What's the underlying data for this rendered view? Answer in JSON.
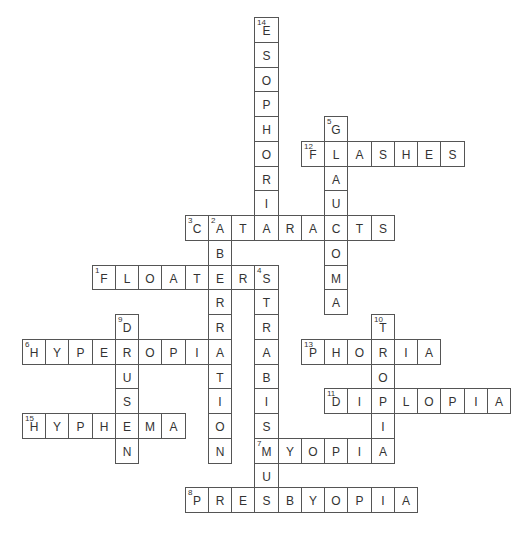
{
  "puzzle": {
    "type": "crossword",
    "grid_origin": {
      "x": 22,
      "y": 17
    },
    "cell": {
      "w": 23.24,
      "h": 24.75
    },
    "line_color": "#555555",
    "text_color": "#333333",
    "words": [
      {
        "number": 1,
        "direction": "across",
        "row": 10,
        "col": 3,
        "answer": "FLOATERS"
      },
      {
        "number": 2,
        "direction": "down",
        "row": 8,
        "col": 8,
        "answer": "ABERRATION"
      },
      {
        "number": 3,
        "direction": "across",
        "row": 8,
        "col": 7,
        "answer": "CATARACTS"
      },
      {
        "number": 4,
        "direction": "down",
        "row": 10,
        "col": 10,
        "answer": "STRABISMUS"
      },
      {
        "number": 5,
        "direction": "down",
        "row": 4,
        "col": 13,
        "answer": "GLAUCOMA"
      },
      {
        "number": 6,
        "direction": "across",
        "row": 13,
        "col": 0,
        "answer": "HYPEROPIA"
      },
      {
        "number": 7,
        "direction": "across",
        "row": 17,
        "col": 10,
        "answer": "MYOPIA"
      },
      {
        "number": 8,
        "direction": "across",
        "row": 19,
        "col": 7,
        "answer": "PRESBYOPIA"
      },
      {
        "number": 9,
        "direction": "down",
        "row": 12,
        "col": 4,
        "answer": "DRUSEN"
      },
      {
        "number": 10,
        "direction": "down",
        "row": 12,
        "col": 15,
        "answer": "TROPIA"
      },
      {
        "number": 11,
        "direction": "across",
        "row": 15,
        "col": 13,
        "answer": "DIPLOPIA"
      },
      {
        "number": 12,
        "direction": "across",
        "row": 5,
        "col": 12,
        "answer": "FLASHES"
      },
      {
        "number": 13,
        "direction": "across",
        "row": 13,
        "col": 12,
        "answer": "PHORIA"
      },
      {
        "number": 14,
        "direction": "down",
        "row": 0,
        "col": 10,
        "answer": "ESOPHORIA"
      },
      {
        "number": 15,
        "direction": "across",
        "row": 16,
        "col": 0,
        "answer": "HYPHEMA"
      }
    ]
  }
}
